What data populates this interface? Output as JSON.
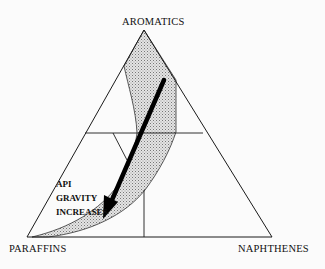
{
  "diagram": {
    "type": "ternary",
    "vertices": {
      "top": "AROMATICS",
      "bottom_left": "PARAFFINS",
      "bottom_right": "NAPHTHENES"
    },
    "annotation": {
      "line1": "API",
      "line2": "GRAVITY",
      "line3": "INCREASES"
    },
    "colors": {
      "line": "#1a1a1a",
      "band_fill": "#cfcfcf",
      "arrow": "#000000",
      "background": "#fbfbfb"
    }
  }
}
